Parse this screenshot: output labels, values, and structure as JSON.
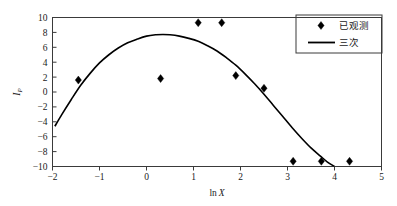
{
  "chart_data": {
    "type": "scatter",
    "title": "",
    "xlabel": "ln X",
    "ylabel": "I",
    "ylabel_sub": "P",
    "xlim": [
      -2,
      5
    ],
    "ylim": [
      -10,
      10
    ],
    "xticks": [
      "-2",
      "-1",
      "0",
      "1",
      "2",
      "3",
      "4",
      "5"
    ],
    "xtick_values": [
      -2,
      -1,
      0,
      1,
      2,
      3,
      4,
      5
    ],
    "yticks": [
      "10",
      "8",
      "6",
      "4",
      "2",
      "0",
      "-2",
      "-4",
      "-6",
      "-8",
      "-10"
    ],
    "ytick_values": [
      10,
      8,
      6,
      4,
      2,
      0,
      -2,
      -4,
      -6,
      -8,
      -10
    ],
    "grid": false,
    "legend_position": "top-right",
    "series": [
      {
        "name": "已观测",
        "marker": "diamond",
        "type": "scatter",
        "color": "#000000",
        "points": [
          {
            "x": -1.45,
            "y": 1.6
          },
          {
            "x": 0.3,
            "y": 1.8
          },
          {
            "x": 1.1,
            "y": 9.3
          },
          {
            "x": 1.6,
            "y": 9.3
          },
          {
            "x": 1.9,
            "y": 2.2
          },
          {
            "x": 2.5,
            "y": 0.5
          },
          {
            "x": 3.12,
            "y": -9.3
          },
          {
            "x": 3.72,
            "y": -9.3
          },
          {
            "x": 4.32,
            "y": -9.3
          }
        ]
      },
      {
        "name": "三次",
        "marker": "line",
        "type": "line",
        "color": "#000000",
        "points": [
          {
            "x": -1.95,
            "y": -4.6
          },
          {
            "x": -1.8,
            "y": -3.0
          },
          {
            "x": -1.6,
            "y": -1.0
          },
          {
            "x": -1.4,
            "y": 0.9
          },
          {
            "x": -1.2,
            "y": 2.5
          },
          {
            "x": -1.0,
            "y": 3.9
          },
          {
            "x": -0.8,
            "y": 5.0
          },
          {
            "x": -0.6,
            "y": 5.9
          },
          {
            "x": -0.4,
            "y": 6.6
          },
          {
            "x": -0.2,
            "y": 7.1
          },
          {
            "x": 0.0,
            "y": 7.5
          },
          {
            "x": 0.2,
            "y": 7.68
          },
          {
            "x": 0.35,
            "y": 7.72
          },
          {
            "x": 0.5,
            "y": 7.68
          },
          {
            "x": 0.7,
            "y": 7.5
          },
          {
            "x": 0.9,
            "y": 7.2
          },
          {
            "x": 1.1,
            "y": 6.8
          },
          {
            "x": 1.3,
            "y": 6.2
          },
          {
            "x": 1.5,
            "y": 5.5
          },
          {
            "x": 1.7,
            "y": 4.6
          },
          {
            "x": 1.9,
            "y": 3.6
          },
          {
            "x": 2.1,
            "y": 2.4
          },
          {
            "x": 2.3,
            "y": 1.1
          },
          {
            "x": 2.5,
            "y": -0.3
          },
          {
            "x": 2.7,
            "y": -1.8
          },
          {
            "x": 2.9,
            "y": -3.3
          },
          {
            "x": 3.1,
            "y": -4.8
          },
          {
            "x": 3.3,
            "y": -6.2
          },
          {
            "x": 3.5,
            "y": -7.5
          },
          {
            "x": 3.7,
            "y": -8.6
          },
          {
            "x": 3.85,
            "y": -9.4
          },
          {
            "x": 4.0,
            "y": -10.0
          }
        ]
      }
    ]
  },
  "legend": {
    "entries": [
      {
        "label": "已观测",
        "symbol": "diamond"
      },
      {
        "label": "三次",
        "symbol": "line"
      }
    ]
  }
}
